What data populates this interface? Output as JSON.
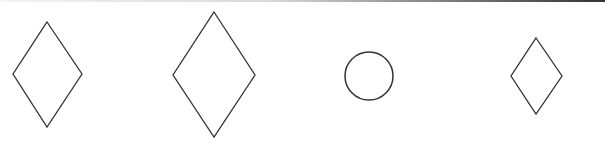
{
  "figure": {
    "stroke_color": "#333333",
    "background": "#ffffff",
    "shapes": [
      {
        "type": "diamond",
        "label": "diamond-1",
        "points": "47,22 82,74 47,127 13,74"
      },
      {
        "type": "diamond",
        "label": "diamond-2",
        "points": "214,12 255,75 214,137 173,75"
      },
      {
        "type": "circle",
        "label": "circle-1",
        "cx": 369,
        "cy": 76,
        "r": 24
      },
      {
        "type": "diamond",
        "label": "diamond-3",
        "points": "536,38 562,76 536,114 511,76"
      }
    ]
  }
}
